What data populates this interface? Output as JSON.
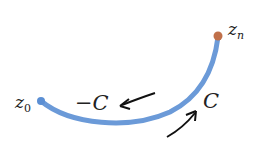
{
  "diagram": {
    "type": "contour-path",
    "start_point": {
      "label_main": "z",
      "label_sub": "0",
      "color": "#5b8fd4"
    },
    "end_point": {
      "label_main": "z",
      "label_sub": "n",
      "color": "#c0704a"
    },
    "curve_color": "#6b9ad8",
    "labels": {
      "reverse": "−C",
      "forward": "C"
    }
  }
}
